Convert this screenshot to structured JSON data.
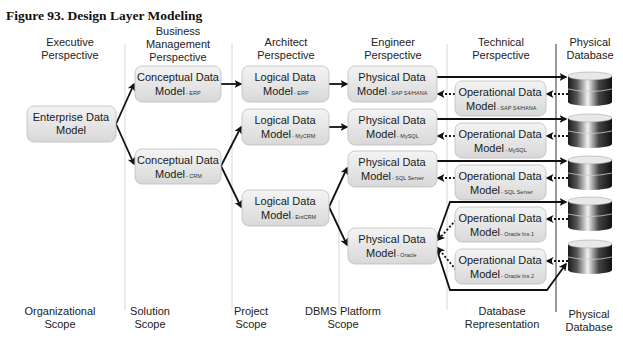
{
  "figure": {
    "title": "Figure 93. Design Layer Modeling"
  },
  "columns": [
    {
      "header": [
        "Executive",
        "Perspective"
      ],
      "footer": [
        "Organizational",
        "Scope"
      ]
    },
    {
      "header": [
        "Business",
        "Management",
        "Perspective"
      ],
      "footer": [
        "Solution",
        "Scope"
      ]
    },
    {
      "header": [
        "Architect",
        "Perspective"
      ],
      "footer": [
        "Project",
        "Scope"
      ]
    },
    {
      "header": [
        "Engineer",
        "Perspective"
      ],
      "footer": [
        "DBMS Platform",
        "Scope"
      ]
    },
    {
      "header": [
        "Technical",
        "Perspective"
      ],
      "footer": [
        "Database",
        "Representation"
      ]
    },
    {
      "header": [
        "Physical",
        "Database"
      ],
      "footer": [
        "Physical",
        "Database"
      ]
    }
  ],
  "boxes": {
    "enterprise": {
      "line1": "Enterprise Data",
      "line2": "Model",
      "sub": ""
    },
    "conceptual_erp": {
      "line1": "Conceptual Data",
      "line2": "Model",
      "sub": "- ERP"
    },
    "conceptual_crm": {
      "line1": "Conceptual Data",
      "line2": "Model",
      "sub": "- CRM"
    },
    "logical_erp": {
      "line1": "Logical Data",
      "line2": "Model",
      "sub": "- ERP"
    },
    "logical_mycrm": {
      "line1": "Logical Data",
      "line2": "Model",
      "sub": "- MyCRM"
    },
    "logical_entcrm": {
      "line1": "Logical Data",
      "line2": "Model",
      "sub": "- EntCRM"
    },
    "physical_sap": {
      "line1": "Physical Data",
      "line2": "Model",
      "sub": "- SAP S4/HANA"
    },
    "physical_mysql": {
      "line1": "Physical Data",
      "line2": "Model",
      "sub": "- MySQL"
    },
    "physical_sqlserver": {
      "line1": "Physical Data",
      "line2": "Model",
      "sub": "- SQL Server"
    },
    "physical_oracle": {
      "line1": "Physical Data",
      "line2": "Model",
      "sub": "- Oracle"
    },
    "operational_sap": {
      "line1": "Operational Data",
      "line2": "Model",
      "sub": "- SAP S4/HANA"
    },
    "operational_mysql": {
      "line1": "Operational Data",
      "line2": "Model",
      "sub": "- MySQL"
    },
    "operational_sqlserver": {
      "line1": "Operational Data",
      "line2": "Model",
      "sub": "- SQL Server"
    },
    "operational_oracle1": {
      "line1": "Operational Data",
      "line2": "Model",
      "sub": "- Oracle Ins 1"
    },
    "operational_oracle2": {
      "line1": "Operational Data",
      "line2": "Model",
      "sub": "- Oracle Ins 2"
    }
  },
  "databases": [
    "sap-db",
    "mysql-db",
    "sqlserver-db",
    "oracle1-db",
    "oracle2-db"
  ],
  "colors": {
    "box_fill_top": "#f3f3f3",
    "box_fill_bottom": "#d9d9d9",
    "arrow": "#111111",
    "divider": "#d6d6d6"
  }
}
